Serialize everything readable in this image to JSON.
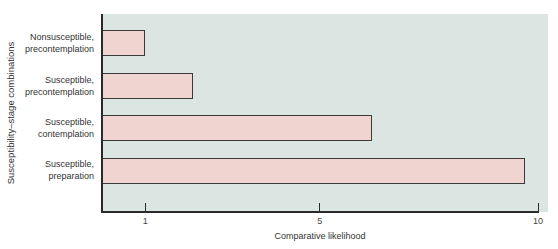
{
  "chart_data": {
    "type": "bar",
    "orientation": "horizontal",
    "title": "",
    "xlabel": "Comparative likelihood",
    "ylabel": "Susceptibility–stage combinations",
    "categories": [
      "Nonsusceptible, precontemplation",
      "Susceptible, precontemplation",
      "Susceptible, contemplation",
      "Susceptible, preparation"
    ],
    "category_lines": [
      [
        "Nonsusceptible,",
        "precontemplation"
      ],
      [
        "Susceptible,",
        "precontemplation"
      ],
      [
        "Susceptible,",
        "contemplation"
      ],
      [
        "Susceptible,",
        "preparation"
      ]
    ],
    "values": [
      1.0,
      2.1,
      6.2,
      9.7
    ],
    "xlim": [
      0,
      10
    ],
    "x_ticks": [
      1,
      5,
      10
    ],
    "x_tick_labels": [
      "1",
      "5",
      "10"
    ],
    "grid": false,
    "legend": null,
    "colors": {
      "plot_background": "#dbe6e2",
      "bar_fill": "#efd4cf",
      "bar_edge": "#3a3a3a",
      "axis": "#2a2a2a"
    }
  }
}
